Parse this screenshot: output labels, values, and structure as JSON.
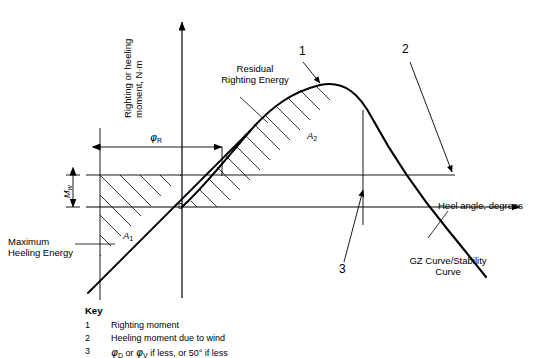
{
  "figure": {
    "axes": {
      "y_label_line1": "Righting or heeling",
      "y_label_line2": "moment, N·m",
      "x_label": "Heel angle, degrees",
      "origin_label": "0"
    },
    "annotations": {
      "residual_line1": "Residual",
      "residual_line2": "Righting Energy",
      "max_heeling_line1": "Maximum",
      "max_heeling_line2": "Heeling Energy",
      "gz_curve_line1": "GZ Curve/Stability",
      "gz_curve_line2": "Curve",
      "area_1": "A",
      "area_1_sub": "1",
      "area_2": "A",
      "area_2_sub": "2",
      "heeling_moment_symbol": "M",
      "heeling_moment_sub": "w",
      "phi_symbol": "φ",
      "phi_sub": "R"
    },
    "callouts": [
      {
        "id": "1",
        "label": "1"
      },
      {
        "id": "2",
        "label": "2"
      },
      {
        "id": "3",
        "label": "3"
      }
    ]
  },
  "key": {
    "title": "Key",
    "items": [
      {
        "num": "1",
        "text": "Righting  moment"
      },
      {
        "num": "2",
        "text": "Heeling moment due to wind"
      },
      {
        "num": "3",
        "text": "φD or φV if less, or 50° if less"
      }
    ],
    "item3_parts": {
      "phi": "φ",
      "sub_d": "D",
      "mid": " or ",
      "phi2": "φ",
      "sub_v": "V",
      "tail": " if less, or 50° if less"
    }
  },
  "colors": {
    "stroke": "#000000",
    "hatch": "#000000",
    "background": "#ffffff"
  }
}
